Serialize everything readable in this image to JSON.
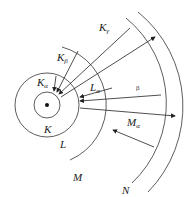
{
  "diagram": {
    "type": "atomic-shell-xray-transitions",
    "nucleus": {
      "cx": 47,
      "cy": 105
    },
    "shells": [
      {
        "name": "K",
        "radius": 13
      },
      {
        "name": "L",
        "radius": 32
      },
      {
        "name": "M",
        "radius": 60
      },
      {
        "name": "N",
        "radius": 89
      },
      {
        "name": "outer",
        "radius": 102
      }
    ],
    "labels": {
      "K": "K",
      "L": "L",
      "M": "M",
      "N": "N",
      "K_alpha_base": "K",
      "K_alpha_sub": "α",
      "K_beta_base": "K",
      "K_beta_sub": "β",
      "K_gamma_base": "K",
      "K_gamma_sub": "γ",
      "L_alpha_base": "L",
      "L_alpha_sub": "α",
      "M_alpha_base": "M",
      "M_alpha_sub": "α",
      "beta": "β"
    },
    "transitions": [
      {
        "name": "Kα",
        "from": "L",
        "to": "K"
      },
      {
        "name": "Kβ",
        "from": "M",
        "to": "K"
      },
      {
        "name": "Kγ",
        "from": "N",
        "to": "K"
      },
      {
        "name": "Lα",
        "from": "M",
        "to": "L"
      },
      {
        "name": "β",
        "from": "N",
        "to": "L"
      },
      {
        "name": "Mα",
        "from": "N",
        "to": "M"
      }
    ]
  }
}
